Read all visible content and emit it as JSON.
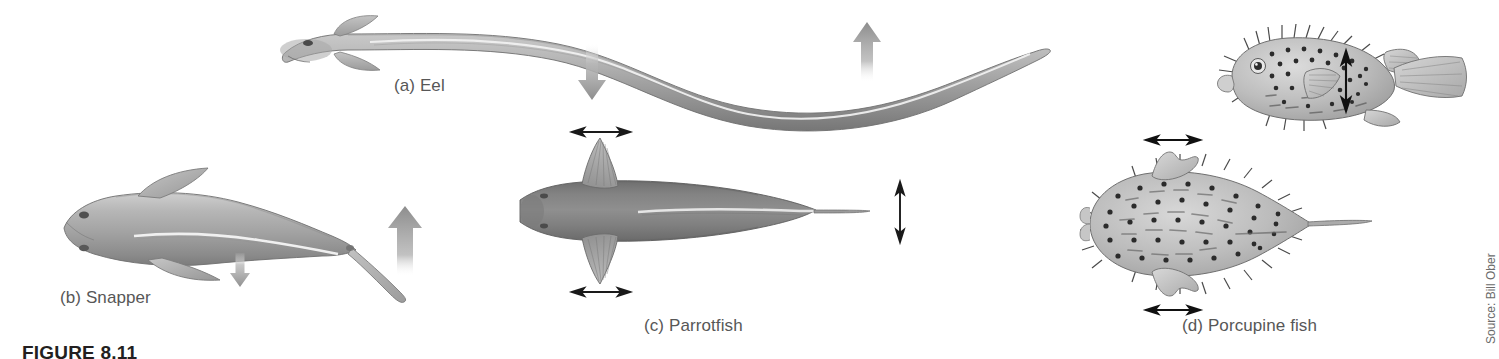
{
  "figure": {
    "number_label": "FIGURE 8.11",
    "source_credit": "Source: Bill Ober",
    "background_color": "#ffffff",
    "caption_color": "#575757",
    "figure_number_color": "#231f20"
  },
  "panels": [
    {
      "id": "a",
      "label": "(a) Eel",
      "subject": "eel",
      "view": "lateral",
      "body_color": "#9a9a9a",
      "swimming_mode": "anguilliform",
      "motion_arrows": [
        {
          "name": "down-arrow",
          "direction": "down",
          "style": "gradient-gray",
          "position": "mid-body"
        },
        {
          "name": "up-arrow",
          "direction": "up",
          "style": "gradient-gray",
          "position": "posterior-body"
        }
      ]
    },
    {
      "id": "b",
      "label": "(b) Snapper",
      "subject": "snapper",
      "view": "lateral",
      "body_color": "#9a9a9a",
      "swimming_mode": "carangiform",
      "motion_arrows": [
        {
          "name": "down-arrow",
          "direction": "down",
          "style": "gradient-gray",
          "position": "mid-body",
          "size": "small"
        },
        {
          "name": "up-arrow",
          "direction": "up",
          "style": "gradient-gray",
          "position": "caudal-fin",
          "size": "large"
        }
      ]
    },
    {
      "id": "c",
      "label": "(c) Parrotfish",
      "subject": "parrotfish",
      "view": "dorsal",
      "body_color": "#7d7d7d",
      "swimming_mode": "labriform",
      "motion_arrows": [
        {
          "name": "horizontal-double-arrow-top",
          "direction": "horizontal",
          "style": "thin-black",
          "position": "left-pectoral-fin"
        },
        {
          "name": "horizontal-double-arrow-bottom",
          "direction": "horizontal",
          "style": "thin-black",
          "position": "right-pectoral-fin"
        },
        {
          "name": "vertical-double-arrow-tail",
          "direction": "vertical",
          "style": "thin-black",
          "position": "caudal-fin"
        }
      ]
    },
    {
      "id": "d",
      "label": "(d) Porcupine fish",
      "subject": "porcupine fish",
      "view": "lateral and dorsal",
      "body_color": "#b4b4b4",
      "swimming_mode": "ostraciiform",
      "motion_arrows": [
        {
          "name": "vertical-double-arrow-pectoral",
          "direction": "vertical",
          "style": "thin-black",
          "position": "pectoral-fin-lateral-view"
        },
        {
          "name": "horizontal-double-arrow-top",
          "direction": "horizontal",
          "style": "thin-black",
          "position": "left-pectoral-fin-dorsal-view"
        },
        {
          "name": "horizontal-double-arrow-bottom",
          "direction": "horizontal",
          "style": "thin-black",
          "position": "right-pectoral-fin-dorsal-view"
        }
      ]
    }
  ]
}
